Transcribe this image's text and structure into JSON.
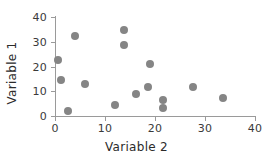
{
  "chart_data": {
    "type": "scatter",
    "title": "",
    "xlabel": "Variable 2",
    "ylabel": "Variable 1",
    "xlim": [
      0,
      40
    ],
    "ylim": [
      0,
      40
    ],
    "xticks": [
      0,
      10,
      20,
      30,
      40
    ],
    "yticks": [
      0,
      10,
      20,
      30,
      40
    ],
    "xtick_labels": [
      "0",
      "10",
      "20",
      "30",
      "40"
    ],
    "ytick_labels": [
      "0",
      "10",
      "20",
      "30",
      "40"
    ],
    "grid": false,
    "legend": null,
    "marker": {
      "shape": "circle",
      "color": "#858585",
      "size": 8
    },
    "series": [
      {
        "name": "points",
        "points": [
          {
            "x": 0.5,
            "y": 22.5
          },
          {
            "x": 1.2,
            "y": 14.5
          },
          {
            "x": 2.6,
            "y": 2.2
          },
          {
            "x": 4.0,
            "y": 32.5
          },
          {
            "x": 6.0,
            "y": 12.9
          },
          {
            "x": 12.0,
            "y": 4.3
          },
          {
            "x": 13.8,
            "y": 34.6
          },
          {
            "x": 13.8,
            "y": 28.7
          },
          {
            "x": 16.2,
            "y": 8.9
          },
          {
            "x": 18.5,
            "y": 11.9
          },
          {
            "x": 19.0,
            "y": 21.2
          },
          {
            "x": 21.5,
            "y": 6.5
          },
          {
            "x": 21.5,
            "y": 3.3
          },
          {
            "x": 27.6,
            "y": 11.9
          },
          {
            "x": 33.6,
            "y": 7.2
          }
        ]
      }
    ]
  },
  "axes": {
    "x_title": "Variable 2",
    "y_title": "Variable 1"
  },
  "colors": {
    "marker": "#858585",
    "axis": "#9a9a9a",
    "text": "#2b2b2b",
    "background": "#ffffff"
  }
}
